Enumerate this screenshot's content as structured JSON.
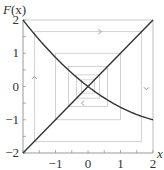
{
  "chart_data": {
    "type": "line",
    "title": "",
    "xlabel": "x",
    "ylabel": "F(x)",
    "xlim": [
      -2,
      2
    ],
    "ylim": [
      -2,
      2
    ],
    "x_ticks": [
      -1,
      0,
      1,
      2
    ],
    "y_ticks": [
      2,
      1,
      0,
      -1,
      -2
    ],
    "grid": false,
    "series": [
      {
        "name": "F(x)",
        "x": [
          -2,
          -1.5,
          -1,
          -0.5,
          0,
          0.5,
          1,
          1.5,
          2
        ],
        "values": [
          2.0,
          1.41,
          0.88,
          0.41,
          0.0,
          -0.34,
          -0.63,
          -0.84,
          -1.0
        ]
      },
      {
        "name": "y = x",
        "x": [
          -2,
          2
        ],
        "values": [
          -2,
          2
        ]
      }
    ],
    "cobweb": {
      "color": "#c8c8c8",
      "rectangles": [
        [
          -1.65,
          1.65
        ],
        [
          -1.0,
          1.0
        ],
        [
          -0.6,
          0.6
        ],
        [
          -0.35,
          0.35
        ],
        [
          -0.2,
          0.2
        ]
      ],
      "arrows": [
        {
          "dir": "up",
          "x": -1.65,
          "y": 0.3
        },
        {
          "dir": "right",
          "x": 0.4,
          "y": 1.65
        },
        {
          "dir": "down",
          "x": 1.8,
          "y": -0.1
        },
        {
          "dir": "left",
          "x": -0.2,
          "y": -0.5
        }
      ]
    }
  },
  "labels": {
    "ylabel_main": "F",
    "ylabel_arg": "(x)",
    "xlabel": "x",
    "y_ticks": [
      "2",
      "1",
      "0",
      "−1",
      "−2"
    ],
    "x_ticks": [
      "−1",
      "0",
      "1",
      "2"
    ]
  }
}
